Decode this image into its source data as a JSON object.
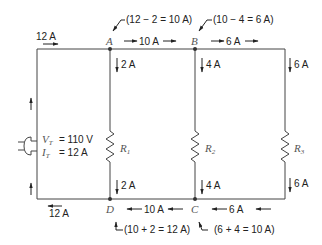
{
  "diagram": {
    "type": "parallel-circuit",
    "source": {
      "voltage_label": "V",
      "voltage_sub": "T",
      "voltage_value": "= 110 V",
      "current_label": "I",
      "current_sub": "T",
      "current_value": "=   12 A",
      "icon": "plug-icon"
    },
    "nodes": {
      "A": "A",
      "B": "B",
      "C": "C",
      "D": "D"
    },
    "resistors": [
      {
        "name": "R",
        "sub": "1",
        "top_current": "2 A",
        "bottom_current": "2 A"
      },
      {
        "name": "R",
        "sub": "2",
        "top_current": "4 A",
        "bottom_current": "4 A"
      },
      {
        "name": "R",
        "sub": "3",
        "top_current": "6 A",
        "bottom_current": "6 A"
      }
    ],
    "top_line": {
      "left_current": "12 A",
      "a_to_b_current": "10 A",
      "b_to_r3_current": "6 A"
    },
    "bottom_line": {
      "left_current": "12 A",
      "c_to_d_current": "10 A",
      "r3_to_c_current": "6 A"
    },
    "annotations": {
      "node_a": "(12 − 2 = 10 A)",
      "node_b": "(10 − 4 = 6 A)",
      "node_d": "(10 + 2 = 12 A)",
      "node_c": "(6 + 4 = 10 A)"
    }
  }
}
